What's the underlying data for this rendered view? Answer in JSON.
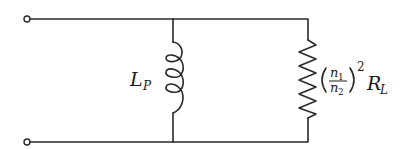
{
  "diagram": {
    "type": "circuit",
    "terminals": [
      {
        "id": "top-terminal",
        "position": "top-left"
      },
      {
        "id": "bottom-terminal",
        "position": "bottom-left"
      }
    ],
    "components": {
      "inductor": {
        "symbol": "L",
        "subscript": "P",
        "label": "L_P"
      },
      "resistor": {
        "ratio_numerator": "n",
        "ratio_numerator_sub": "1",
        "ratio_denominator": "n",
        "ratio_denominator_sub": "2",
        "exponent": "2",
        "symbol": "R",
        "subscript": "L",
        "label": "(n1/n2)^2 R_L"
      }
    },
    "colors": {
      "line": "#2a2a2a",
      "background": "#ffffff"
    }
  }
}
